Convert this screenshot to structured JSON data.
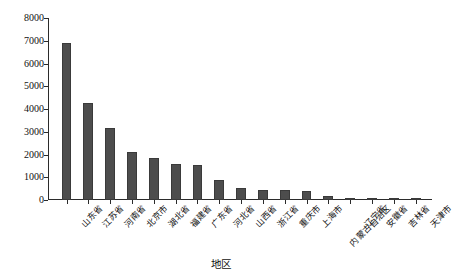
{
  "chart_data": {
    "type": "bar",
    "title": "",
    "subtitle": "",
    "xlabel": "地区",
    "ylabel": "雨洪水利用量/万m³",
    "ylabel_base": "雨洪水利用量/万m",
    "ylabel_sup": "3",
    "ylim": [
      0,
      8000
    ],
    "grid": false,
    "legend": null,
    "legend_position": "none",
    "ytick_labels": [
      "8000",
      "7000",
      "6000",
      "5000",
      "4000",
      "3000",
      "2000",
      "1000",
      "0"
    ],
    "ytick_values": [
      8000,
      7000,
      6000,
      5000,
      4000,
      3000,
      2000,
      1000,
      0
    ],
    "categories": [
      "山东省",
      "江苏省",
      "河南省",
      "北京市",
      "湖北省",
      "福建省",
      "广东省",
      "河北省",
      "山西省",
      "浙江省",
      "重庆市",
      "上海市",
      "内蒙古自治区",
      "辽宁省",
      "安徽省",
      "吉林省",
      "天津市"
    ],
    "values": [
      6900,
      4250,
      3150,
      2110,
      1850,
      1600,
      1520,
      900,
      520,
      450,
      430,
      400,
      170,
      60,
      35,
      20,
      10
    ],
    "series": [
      {
        "name": "雨洪水利用量",
        "values": [
          6900,
          4250,
          3150,
          2110,
          1850,
          1600,
          1520,
          900,
          520,
          450,
          430,
          400,
          170,
          60,
          35,
          20,
          10
        ]
      }
    ],
    "bar_color": "#4d4d4d",
    "axis_color": "#2b2b2b",
    "background": "#ffffff"
  }
}
